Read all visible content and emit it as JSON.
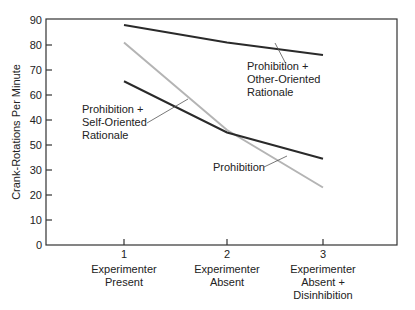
{
  "chart_data": {
    "type": "line",
    "title": "",
    "xlabel": "",
    "ylabel": "Crank-Rotations Per Minute",
    "ylim": [
      0,
      90
    ],
    "y_ticks": [
      0,
      10,
      20,
      30,
      40,
      50,
      60,
      70,
      80,
      90
    ],
    "y_tick_labels_as_printed": [
      "0",
      "10",
      "20",
      "30",
      "50",
      "40",
      "60",
      "70",
      "80",
      "90"
    ],
    "grid": false,
    "legend": "inline annotations",
    "categories": [
      {
        "num": "1",
        "lines": [
          "Experimenter",
          "Present"
        ]
      },
      {
        "num": "2",
        "lines": [
          "Experimenter",
          "Absent"
        ]
      },
      {
        "num": "3",
        "lines": [
          "Experimenter",
          "Absent +",
          "Disinhibition"
        ]
      }
    ],
    "series": [
      {
        "name": "Prohibition + Other-Oriented Rationale",
        "label_lines": [
          "Prohibition +",
          "Other-Oriented",
          "Rationale"
        ],
        "color": "#2a2a2a",
        "values": [
          88,
          81,
          76
        ]
      },
      {
        "name": "Prohibition + Self-Oriented Rationale",
        "label_lines": [
          "Prohibition +",
          "Self-Oriented",
          "Rationale"
        ],
        "color": "#2a2a2a",
        "values": [
          65.5,
          45,
          34.5
        ]
      },
      {
        "name": "Prohibition",
        "label_lines": [
          "Prohibition"
        ],
        "color": "#b4b4b4",
        "values": [
          81,
          46,
          23
        ]
      }
    ]
  }
}
